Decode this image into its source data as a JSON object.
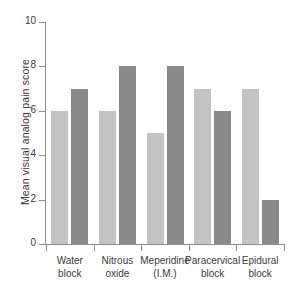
{
  "chart_data": {
    "type": "bar",
    "title": "",
    "xlabel": "",
    "ylabel": "Mean visual analog pain score",
    "ylim": [
      0,
      10
    ],
    "yticks": [
      0,
      2,
      4,
      6,
      8,
      10
    ],
    "grid": false,
    "legend": "none",
    "categories": [
      "Water block",
      "Nitrous oxide",
      "Meperidine (I.M.)",
      "Paracervical block",
      "Epidural block"
    ],
    "category_lines": [
      [
        "Water",
        "block"
      ],
      [
        "Nitrous",
        "oxide"
      ],
      [
        "Meperidine",
        "(I.M.)"
      ],
      [
        "Paracervical",
        "block"
      ],
      [
        "Epidural",
        "block"
      ]
    ],
    "series": [
      {
        "name": "light",
        "color": "#c3c3c3",
        "values": [
          6,
          6,
          5,
          7,
          7
        ]
      },
      {
        "name": "dark",
        "color": "#8a8a8a",
        "values": [
          7,
          8,
          8,
          6,
          2
        ]
      }
    ]
  },
  "axis": {
    "tick_labels": [
      "0",
      "2",
      "4",
      "6",
      "8",
      "10"
    ]
  },
  "colors": {
    "light_bar": "#c3c3c3",
    "dark_bar": "#8a8a8a",
    "axis": "#8f8f8f",
    "text": "#3b3b3b",
    "background": "#ffffff"
  }
}
